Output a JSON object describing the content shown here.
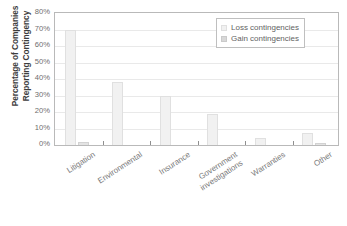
{
  "chart_data": {
    "type": "bar",
    "title": "",
    "subtitle": "",
    "xlabel": "",
    "ylabel": "Percentage of Companies\nReporting Contingency",
    "ylim": [
      0,
      80
    ],
    "ytick_labels": [
      "80%",
      "70%",
      "60%",
      "50%",
      "40%",
      "30%",
      "20%",
      "10%",
      "0%"
    ],
    "ytick_values": [
      80,
      70,
      60,
      50,
      40,
      30,
      20,
      10,
      0
    ],
    "grid": true,
    "legend_position": "top-right",
    "categories": [
      "Litigation",
      "Environmental",
      "Insurance",
      "Government\ninvestigations",
      "Warranties",
      "Other"
    ],
    "series": [
      {
        "name": "Loss contingencies",
        "color": "#f1f1f1",
        "values": [
          70,
          38,
          30,
          19,
          4.5,
          7
        ]
      },
      {
        "name": "Gain contingencies",
        "color": "#e3e3e3",
        "values": [
          2,
          0,
          0,
          0,
          0,
          1.5
        ]
      }
    ]
  },
  "legend": {
    "items": [
      {
        "label": "Loss contingencies"
      },
      {
        "label": "Gain contingencies"
      }
    ]
  }
}
